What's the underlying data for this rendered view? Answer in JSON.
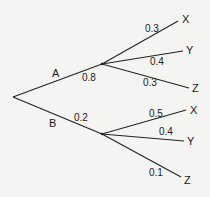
{
  "diagram": {
    "type": "probability-tree",
    "first_stage": [
      {
        "event": "A",
        "probability": "0.8"
      },
      {
        "event": "B",
        "probability": "0.2"
      }
    ],
    "second_stage": {
      "A": [
        {
          "event": "X",
          "probability": "0.3"
        },
        {
          "event": "Y",
          "probability": "0.4"
        },
        {
          "event": "Z",
          "probability": "0.3"
        }
      ],
      "B": [
        {
          "event": "X",
          "probability": "0.5"
        },
        {
          "event": "Y",
          "probability": "0.4"
        },
        {
          "event": "Z",
          "probability": "0.1"
        }
      ]
    }
  }
}
